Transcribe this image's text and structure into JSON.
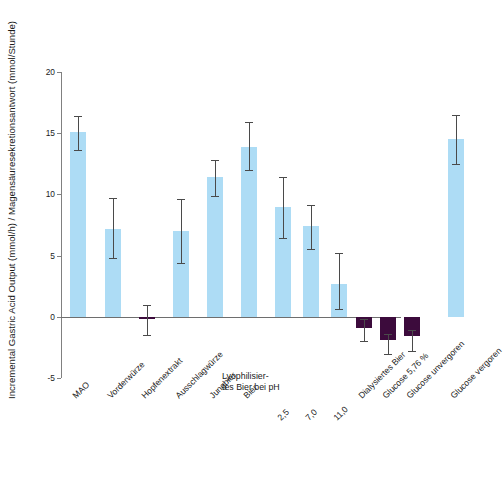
{
  "chart_data": {
    "type": "bar",
    "title": "",
    "xlabel": "",
    "ylabel": "Incremental Gastric Acid Output (mmol/h) / Magensäuresekretionsantwort (mmol/Stunde)",
    "ylim": [
      -5,
      20
    ],
    "yticks": [
      -5,
      0,
      5,
      10,
      15,
      20
    ],
    "ytick_labels": [
      "-5",
      "0",
      "5",
      "10",
      "15",
      "20"
    ],
    "grid": false,
    "legend": null,
    "zero_line": 0,
    "group_header": {
      "line1": "Lyophilisier-",
      "line2": "tes Bier bei pH"
    },
    "categories": [
      "MAO",
      "Vorderwürze",
      "Hopfenextrakt",
      "Ausschlagwürze",
      "Jungbier",
      "Bier",
      "2,5",
      "7,0",
      "11,0",
      "Dialysiertes Bier",
      "Glucose 5,76 %",
      "Glucose unvergoren",
      "Glucose vergoren"
    ],
    "values": [
      15.1,
      7.2,
      -0.2,
      7.0,
      11.4,
      13.9,
      9.0,
      7.4,
      2.7,
      -0.9,
      -1.9,
      -1.6,
      14.5
    ],
    "err_low": [
      13.6,
      4.8,
      -1.5,
      4.4,
      9.9,
      12.0,
      6.4,
      5.5,
      0.6,
      -2.0,
      -3.0,
      -2.8,
      12.5
    ],
    "err_high": [
      16.4,
      9.7,
      1.0,
      9.6,
      12.8,
      15.9,
      11.4,
      9.1,
      5.2,
      -0.2,
      -1.4,
      -1.1,
      16.5
    ],
    "bar_colors": [
      "#addcf5",
      "#addcf5",
      "#3c0b3c",
      "#addcf5",
      "#addcf5",
      "#addcf5",
      "#addcf5",
      "#addcf5",
      "#addcf5",
      "#3c0b3c",
      "#3c0b3c",
      "#3c0b3c",
      "#addcf5"
    ],
    "colors": {
      "positive_bar": "#addcf5",
      "negative_bar": "#3c0b3c",
      "axis": "#808080",
      "error_bar": "#4a4a4a",
      "text": "#1a1a1a",
      "background": "#ffffff"
    }
  }
}
